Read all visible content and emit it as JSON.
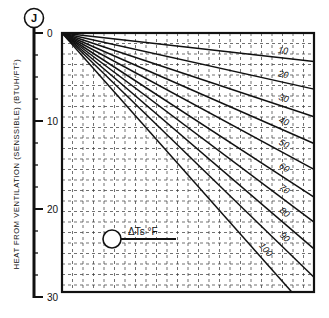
{
  "chart_data": {
    "type": "line",
    "title": "",
    "badge": "J",
    "ylabel": "HEAT FROM VENTILATION (SENSSIBLE) (BTUH/FT²)",
    "xlabel": "",
    "ylim": [
      0,
      30
    ],
    "y_axis_inverted": true,
    "y_ticks": [
      0,
      10,
      20,
      30
    ],
    "y_minor_ticks": [
      2.5,
      5,
      7.5,
      12.5,
      15,
      17.5,
      22.5,
      25,
      27.5
    ],
    "grid": true,
    "grid_style": "dashed",
    "legend": {
      "symbol": "circle-with-arrow",
      "label": "ΔTs °F",
      "position": "lower-left"
    },
    "x": [
      0,
      1
    ],
    "series": [
      {
        "name": "10",
        "label": "10",
        "values": [
          0,
          3.3
        ]
      },
      {
        "name": "20",
        "label": "20",
        "values": [
          0,
          6.5
        ]
      },
      {
        "name": "30",
        "label": "30",
        "values": [
          0,
          9.7
        ]
      },
      {
        "name": "40",
        "label": "40",
        "values": [
          0,
          12.8
        ]
      },
      {
        "name": "50",
        "label": "50",
        "values": [
          0,
          15.8
        ]
      },
      {
        "name": "60",
        "label": "60",
        "values": [
          0,
          19.0
        ]
      },
      {
        "name": "70",
        "label": "70",
        "values": [
          0,
          21.9
        ]
      },
      {
        "name": "80",
        "label": "80",
        "values": [
          0,
          25.0
        ]
      },
      {
        "name": "90",
        "label": "90",
        "values": [
          0,
          28.3
        ]
      },
      {
        "name": "100",
        "label": "100",
        "values": [
          0,
          32.9
        ]
      }
    ]
  },
  "layout": {
    "frame": {
      "left": 62,
      "top": 33,
      "right": 314,
      "bottom": 292
    },
    "axis_x": 34,
    "axis_top": 33,
    "axis_bottom": 297,
    "ink": "#111111"
  }
}
